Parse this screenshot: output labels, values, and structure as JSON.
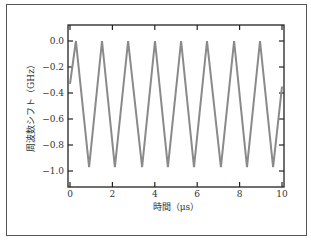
{
  "chart_data": {
    "type": "line",
    "title": "",
    "xlabel": "時間（μs）",
    "ylabel": "周波数シフト（GHz）",
    "xlim": [
      -0.1,
      10.1
    ],
    "ylim": [
      -1.12,
      0.12
    ],
    "xticks": [
      0,
      2,
      4,
      6,
      8,
      10
    ],
    "xtick_labels": [
      "0",
      "2",
      "4",
      "6",
      "8",
      "10"
    ],
    "yticks": [
      0.0,
      -0.2,
      -0.4,
      -0.6,
      -0.8,
      -1.0
    ],
    "ytick_labels": [
      "0.0",
      "−0.2",
      "−0.4",
      "−0.6",
      "−0.8",
      "−1.0"
    ],
    "grid": false,
    "legend": null,
    "line_color": "#8a8a8a",
    "series": [
      {
        "name": "frequency shift",
        "x": [
          0.0,
          0.28,
          0.9,
          1.51,
          2.12,
          2.74,
          3.4,
          4.01,
          4.62,
          5.24,
          5.85,
          6.46,
          7.12,
          7.74,
          8.35,
          8.96,
          9.58,
          10.0
        ],
        "y": [
          -0.33,
          0.0,
          -0.97,
          0.0,
          -0.97,
          0.0,
          -0.97,
          0.0,
          -0.97,
          0.0,
          -0.97,
          0.0,
          -0.97,
          0.0,
          -0.97,
          0.0,
          -0.97,
          -0.35
        ]
      }
    ]
  }
}
